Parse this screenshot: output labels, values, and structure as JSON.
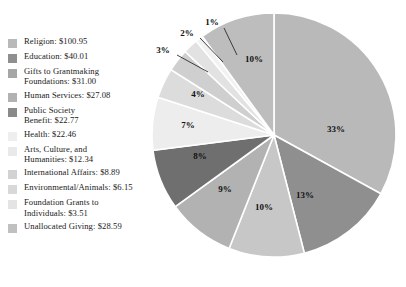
{
  "chart_data": {
    "type": "pie",
    "title": "",
    "subtitle": "",
    "xlabel": "",
    "ylabel": "",
    "units": "billions of dollars",
    "legend_position": "left",
    "grid": false,
    "total": 303.75,
    "categories": [
      "Religion",
      "Education",
      "Gifts to Grantmaking Foundations",
      "Human Services",
      "Public Society Benefit",
      "Health",
      "Arts, Culture, and Humanities",
      "International Affairs",
      "Environmental/Animals",
      "Foundation Grants to Individuals",
      "Unallocated Giving"
    ],
    "values": [
      100.95,
      40.01,
      31.0,
      27.08,
      22.77,
      22.46,
      12.34,
      8.89,
      6.15,
      3.51,
      28.59
    ],
    "percent_labels": [
      "33%",
      "13%",
      "10%",
      "9%",
      "8%",
      "7%",
      "4%",
      "3%",
      "2%",
      "1%",
      "10%"
    ],
    "colors": [
      "#b9b9b9",
      "#8f8f8f",
      "#c7c7c7",
      "#b2b2b2",
      "#6f6f6f",
      "#ededed",
      "#dcdcdc",
      "#cfcfcf",
      "#e2e2e2",
      "#f2f2f2",
      "#bdbdbd"
    ],
    "slice_angles_deg": [
      118.8,
      46.8,
      36.0,
      32.4,
      28.8,
      25.2,
      14.4,
      10.8,
      7.2,
      3.6,
      36.0
    ]
  },
  "legend": {
    "items": [
      {
        "label": "Religion: $100.95",
        "swatch": "#b9b9b9",
        "name": "legend-item-religion"
      },
      {
        "label": "Education: $40.01",
        "swatch": "#8f8f8f",
        "name": "legend-item-education"
      },
      {
        "label": "Gifts to Grantmaking\nFoundations: $31.00",
        "swatch": "#a6a6a6",
        "name": "legend-item-gifts-to-grantmaking-foundations"
      },
      {
        "label": "Human Services: $27.08",
        "swatch": "#b2b2b2",
        "name": "legend-item-human-services"
      },
      {
        "label": "Public Society\nBenefit: $22.77",
        "swatch": "#8a8a8a",
        "name": "legend-item-public-society-benefit"
      },
      {
        "label": "Health: $22.46",
        "swatch": "#eeeeee",
        "name": "legend-item-health"
      },
      {
        "label": "Arts, Culture, and\nHumanities: $12.34",
        "swatch": "#e9e9e9",
        "name": "legend-item-arts-culture-humanities"
      },
      {
        "label": "International Affairs: $8.89",
        "swatch": "#d2d2d2",
        "name": "legend-item-international-affairs"
      },
      {
        "label": "Environmental/Animals: $6.15",
        "swatch": "#d8d8d8",
        "name": "legend-item-environmental-animals"
      },
      {
        "label": "Foundation Grants to\nIndividuals: $3.51",
        "swatch": "#e4e4e4",
        "name": "legend-item-foundation-grants-to-individuals"
      },
      {
        "label": "Unallocated Giving: $28.59",
        "swatch": "#c0c0c0",
        "name": "legend-item-unallocated-giving"
      }
    ]
  },
  "pie": {
    "inside_labels": [
      {
        "text": "33%",
        "x": 186,
        "y": 120
      },
      {
        "text": "13%",
        "x": 155,
        "y": 186
      },
      {
        "text": "10%",
        "x": 114,
        "y": 198
      },
      {
        "text": "9%",
        "x": 75,
        "y": 180
      },
      {
        "text": "8%",
        "x": 50,
        "y": 147
      },
      {
        "text": "7%",
        "x": 38,
        "y": 116
      },
      {
        "text": "4%",
        "x": 48,
        "y": 85
      },
      {
        "text": "10%",
        "x": 104,
        "y": 50
      }
    ],
    "outside_labels": [
      {
        "text": "3%",
        "x": 13,
        "y": 41
      },
      {
        "text": "2%",
        "x": 37,
        "y": 24
      },
      {
        "text": "1%",
        "x": 62,
        "y": 13
      }
    ]
  }
}
